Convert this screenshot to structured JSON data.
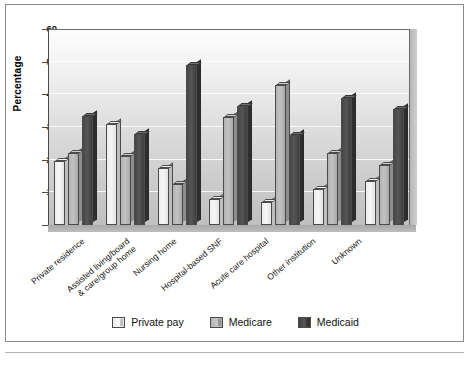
{
  "chart_data": {
    "type": "bar",
    "title": "",
    "subtitle": "",
    "xlabel": "",
    "ylabel": "Percentage",
    "ylim": [
      0,
      60
    ],
    "yticks": [
      0,
      10,
      20,
      30,
      40,
      50,
      60
    ],
    "grid": true,
    "legend_position": "bottom",
    "categories": [
      "Private residence",
      "Assisted living/board\n& care/group home",
      "Nursing home",
      "Hospital-based SNF",
      "Acute care hospital",
      "Other institution",
      "Unknown"
    ],
    "series": [
      {
        "name": "Private pay",
        "color": "#efefef",
        "values": [
          19.5,
          31,
          17.5,
          8,
          7,
          11,
          13.5
        ]
      },
      {
        "name": "Medicare",
        "color": "#bcbcbc",
        "values": [
          22,
          21,
          12.5,
          33,
          43,
          22,
          18.5
        ]
      },
      {
        "name": "Medicaid",
        "color": "#4a4a4a",
        "values": [
          33.5,
          28,
          49,
          36.5,
          27.5,
          39,
          35.5
        ]
      }
    ]
  },
  "axis": {
    "y_title": "Percentage",
    "y_tick_labels": [
      "60",
      "50",
      "40",
      "30",
      "20",
      "10",
      "0"
    ]
  },
  "legend": {
    "items": [
      {
        "label": "Private pay"
      },
      {
        "label": "Medicare"
      },
      {
        "label": "Medicaid"
      }
    ]
  }
}
